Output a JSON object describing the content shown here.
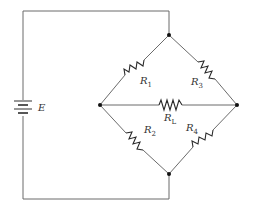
{
  "diagram": {
    "type": "Wheatstone bridge circuit",
    "source": {
      "label": "E"
    },
    "resistors": [
      {
        "id": "R1",
        "label": "R",
        "subscript": "1"
      },
      {
        "id": "R2",
        "label": "R",
        "subscript": "2"
      },
      {
        "id": "R3",
        "label": "R",
        "subscript": "3"
      },
      {
        "id": "R4",
        "label": "R",
        "subscript": "4"
      },
      {
        "id": "RL",
        "label": "R",
        "subscript": "L"
      }
    ],
    "nodes": [
      "top",
      "left",
      "right",
      "bottom"
    ],
    "colors": {
      "wire": "#6b6b6b",
      "component": "#2a2a2a",
      "node": "#111111",
      "background": "#ffffff"
    }
  }
}
